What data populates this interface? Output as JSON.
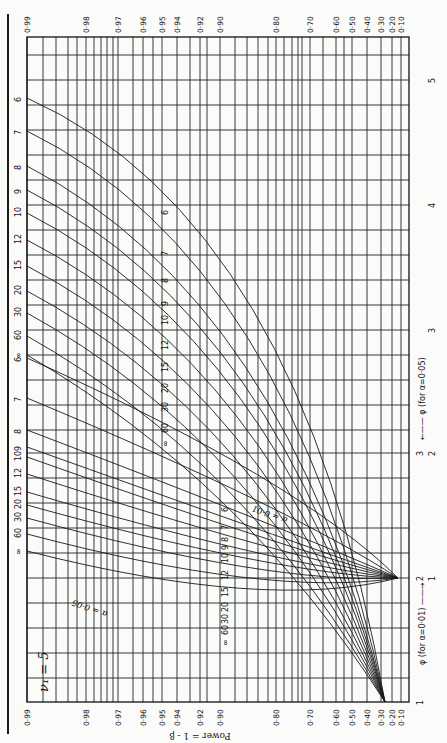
{
  "chart_data": {
    "type": "line",
    "orientation": "rotated 90° clockwise (power axis runs horizontally, φ axis runs vertically)",
    "nu1_label": "ν₁ = 5",
    "nu2_axis_label": "ν₂ = ∞ 60 30 20 15 12 10 9 8 7",
    "ylabel": "Power = 1 - β",
    "power_ticks": [
      "0·99",
      "0·98",
      "0·97",
      "0·96",
      "0·95",
      "0·94",
      "0·92",
      "0·90",
      "0·80",
      "0·70",
      "0·60",
      "0·50",
      "0·40",
      "0·30",
      "0·20",
      "0·10"
    ],
    "phi_axis_alpha_01": {
      "label": "φ (for α=0·01)",
      "ticks": [
        "1",
        "2",
        "3"
      ]
    },
    "phi_axis_alpha_05": {
      "label": "φ (for α=0·05)",
      "ticks": [
        "1",
        "2",
        "3",
        "4",
        "5"
      ]
    },
    "alpha_labels": [
      "α = 0·05",
      "α = 0·01"
    ],
    "nu2_values": [
      "6",
      "7",
      "8",
      "9",
      "10",
      "12",
      "15",
      "20",
      "30",
      "60",
      "∞"
    ],
    "series_alpha_05": [
      {
        "nu2": "6",
        "phi_at_power_099": 4.84,
        "phi_at_power_090": 3.6,
        "phi_at_power_050": 2.3
      },
      {
        "nu2": "7",
        "phi_at_power_099": 4.57,
        "phi_at_power_090": 3.35,
        "phi_at_power_050": 2.2
      },
      {
        "nu2": "8",
        "phi_at_power_099": 4.29,
        "phi_at_power_090": 3.2,
        "phi_at_power_050": 2.1
      },
      {
        "nu2": "9",
        "phi_at_power_099": 4.1,
        "phi_at_power_090": 3.1,
        "phi_at_power_050": 2.05
      },
      {
        "nu2": "10",
        "phi_at_power_099": 3.9,
        "phi_at_power_090": 3.0,
        "phi_at_power_050": 2.0
      },
      {
        "nu2": "12",
        "phi_at_power_099": 3.7,
        "phi_at_power_090": 2.9,
        "phi_at_power_050": 1.95
      },
      {
        "nu2": "15",
        "phi_at_power_099": 3.5,
        "phi_at_power_090": 2.75,
        "phi_at_power_050": 1.9
      },
      {
        "nu2": "20",
        "phi_at_power_099": 3.3,
        "phi_at_power_090": 2.65,
        "phi_at_power_050": 1.85
      },
      {
        "nu2": "30",
        "phi_at_power_099": 3.1,
        "phi_at_power_090": 2.55,
        "phi_at_power_050": 1.8
      },
      {
        "nu2": "60",
        "phi_at_power_099": 2.95,
        "phi_at_power_090": 2.45,
        "phi_at_power_050": 1.75
      },
      {
        "nu2": "∞",
        "phi_at_power_099": 2.8,
        "phi_at_power_090": 2.35,
        "phi_at_power_050": 1.7
      }
    ],
    "series_alpha_01": [
      {
        "nu2": "6",
        "phi_at_power_099": 3.75,
        "phi_at_power_090": 3.1,
        "phi_at_power_050": 2.4
      },
      {
        "nu2": "7",
        "phi_at_power_099": 3.45,
        "phi_at_power_090": 2.9,
        "phi_at_power_050": 2.3
      },
      {
        "nu2": "8",
        "phi_at_power_099": 3.2,
        "phi_at_power_090": 2.75,
        "phi_at_power_050": 2.25
      },
      {
        "nu2": "9",
        "phi_at_power_099": 3.05,
        "phi_at_power_090": 2.65,
        "phi_at_power_050": 2.2
      },
      {
        "nu2": "10",
        "phi_at_power_099": 2.95,
        "phi_at_power_090": 2.6,
        "phi_at_power_050": 2.15
      },
      {
        "nu2": "12",
        "phi_at_power_099": 2.85,
        "phi_at_power_090": 2.5,
        "phi_at_power_050": 2.1
      },
      {
        "nu2": "15",
        "phi_at_power_099": 2.7,
        "phi_at_power_090": 2.4,
        "phi_at_power_050": 2.05
      },
      {
        "nu2": "20",
        "phi_at_power_099": 2.6,
        "phi_at_power_090": 2.3,
        "phi_at_power_050": 2.0
      },
      {
        "nu2": "30",
        "phi_at_power_099": 2.5,
        "phi_at_power_090": 2.25,
        "phi_at_power_050": 1.95
      },
      {
        "nu2": "60",
        "phi_at_power_099": 2.4,
        "phi_at_power_090": 2.15,
        "phi_at_power_050": 1.9
      },
      {
        "nu2": "∞",
        "phi_at_power_099": 2.3,
        "phi_at_power_090": 2.1,
        "phi_at_power_050": 1.85
      }
    ],
    "grid": true
  },
  "layout": {
    "frame": {
      "left": 27,
      "right": 409,
      "top": 37,
      "bottom": 702
    },
    "power_tick_x": [
      27,
      86,
      118,
      143,
      162,
      177,
      200,
      220,
      276,
      310,
      336,
      352,
      367,
      381,
      392,
      401
    ],
    "extra_vlines": [
      43,
      56,
      68,
      77,
      94,
      101,
      107,
      113,
      133,
      153,
      190,
      207,
      235,
      247,
      258,
      268,
      284,
      292,
      298,
      302,
      323,
      344
    ],
    "hlines": [
      55,
      80,
      105,
      130,
      155,
      180,
      205,
      230,
      255,
      280,
      305,
      330,
      355,
      380,
      405,
      430,
      453,
      478,
      503,
      528,
      553,
      578,
      603,
      628,
      653,
      678
    ],
    "phi01_ticks_y": [
      702,
      578,
      453
    ],
    "phi05_ticks_y": [
      578,
      453,
      330,
      205,
      80
    ],
    "curves05": [
      {
        "label": "6",
        "y0": 98,
        "cx": 300,
        "cy": 220,
        "x1": 385,
        "y1": 702,
        "lx": 168,
        "ly": 215
      },
      {
        "label": "7",
        "y0": 131,
        "cx": 290,
        "cy": 260,
        "x1": 385,
        "y1": 702,
        "lx": 168,
        "ly": 256
      },
      {
        "label": "8",
        "y0": 166,
        "cx": 285,
        "cy": 300,
        "x1": 385,
        "y1": 702,
        "lx": 168,
        "ly": 283
      },
      {
        "label": "9",
        "y0": 190,
        "cx": 280,
        "cy": 320,
        "x1": 385,
        "y1": 702,
        "lx": 168,
        "ly": 306
      },
      {
        "label": "10",
        "y0": 213,
        "cx": 275,
        "cy": 340,
        "x1": 385,
        "y1": 702,
        "lx": 168,
        "ly": 325
      },
      {
        "label": "12",
        "y0": 240,
        "cx": 270,
        "cy": 365,
        "x1": 385,
        "y1": 702,
        "lx": 168,
        "ly": 350
      },
      {
        "label": "15",
        "y0": 266,
        "cx": 265,
        "cy": 390,
        "x1": 385,
        "y1": 702,
        "lx": 168,
        "ly": 372
      },
      {
        "label": "20",
        "y0": 291,
        "cx": 260,
        "cy": 415,
        "x1": 385,
        "y1": 702,
        "lx": 168,
        "ly": 393
      },
      {
        "label": "30",
        "y0": 313,
        "cx": 255,
        "cy": 438,
        "x1": 385,
        "y1": 702,
        "lx": 168,
        "ly": 412
      },
      {
        "label": "60",
        "y0": 336,
        "cx": 250,
        "cy": 462,
        "x1": 385,
        "y1": 702,
        "lx": 168,
        "ly": 433
      },
      {
        "label": "∞",
        "y0": 355,
        "cx": 245,
        "cy": 482,
        "x1": 385,
        "y1": 702,
        "lx": 168,
        "ly": 447
      }
    ],
    "curves01": [
      {
        "label": "6",
        "y0": 358,
        "cx": 300,
        "cy": 480,
        "x1": 398,
        "y1": 578,
        "lx": 228,
        "ly": 512
      },
      {
        "label": "7",
        "y0": 398,
        "cx": 295,
        "cy": 510,
        "x1": 398,
        "y1": 578,
        "lx": 228,
        "ly": 530
      },
      {
        "label": "8",
        "y0": 430,
        "cx": 290,
        "cy": 530,
        "x1": 398,
        "y1": 578,
        "lx": 228,
        "ly": 542
      },
      {
        "label": "9",
        "y0": 447,
        "cx": 287,
        "cy": 540,
        "x1": 398,
        "y1": 578,
        "lx": 228,
        "ly": 550
      },
      {
        "label": "10",
        "y0": 457,
        "cx": 284,
        "cy": 548,
        "x1": 398,
        "y1": 578,
        "lx": 228,
        "ly": 563
      },
      {
        "label": "12",
        "y0": 474,
        "cx": 281,
        "cy": 556,
        "x1": 398,
        "y1": 578,
        "lx": 228,
        "ly": 580
      },
      {
        "label": "15",
        "y0": 492,
        "cx": 278,
        "cy": 565,
        "x1": 398,
        "y1": 578,
        "lx": 228,
        "ly": 597
      },
      {
        "label": "20",
        "y0": 505,
        "cx": 275,
        "cy": 574,
        "x1": 398,
        "y1": 578,
        "lx": 228,
        "ly": 612
      },
      {
        "label": "30",
        "y0": 518,
        "cx": 272,
        "cy": 585,
        "x1": 398,
        "y1": 578,
        "lx": 228,
        "ly": 624
      },
      {
        "label": "60",
        "y0": 534,
        "cx": 269,
        "cy": 598,
        "x1": 398,
        "y1": 578,
        "lx": 228,
        "ly": 635
      },
      {
        "label": "∞",
        "y0": 551,
        "cx": 266,
        "cy": 612,
        "x1": 398,
        "y1": 578,
        "lx": 228,
        "ly": 646
      }
    ]
  }
}
